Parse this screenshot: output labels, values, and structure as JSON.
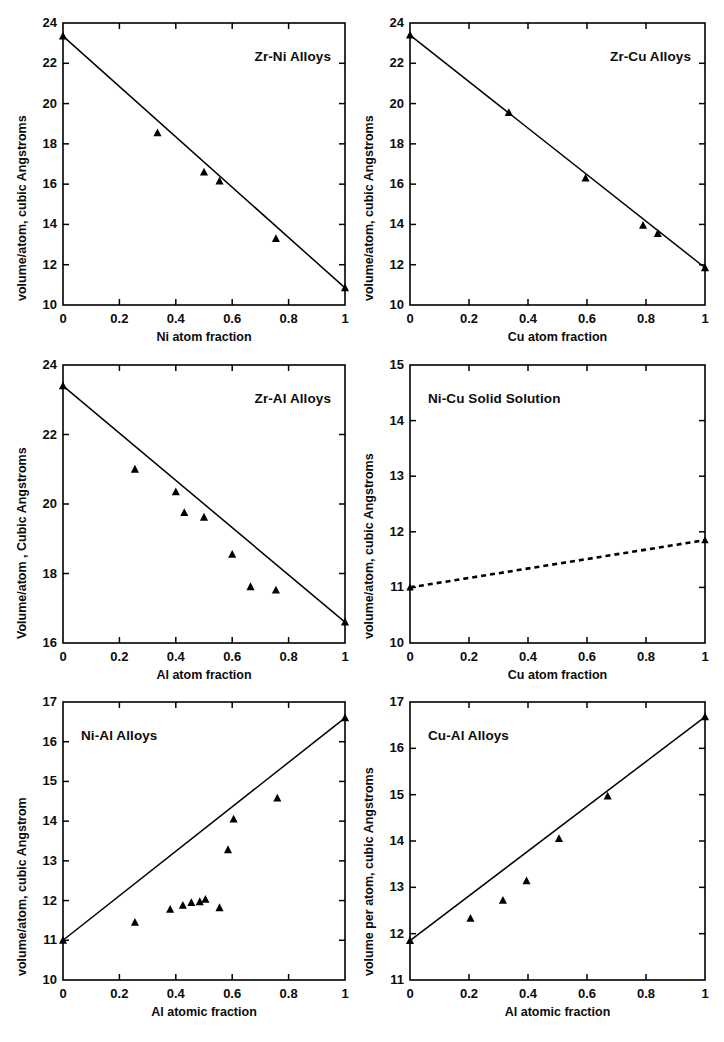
{
  "figure": {
    "panel_count": 6,
    "marker": "filled-triangle",
    "line_color": "#000000",
    "background": "#ffffff"
  },
  "chart_data": [
    {
      "id": "zr-ni",
      "type": "scatter",
      "title": "Zr-Ni Alloys",
      "title_pos": "top-right",
      "xlabel": "Ni atom fraction",
      "ylabel": "volume/atom, cubic Angstroms",
      "xlim": [
        0,
        1
      ],
      "ylim": [
        10,
        24
      ],
      "xticks": [
        0,
        0.2,
        0.4,
        0.6,
        0.8,
        1
      ],
      "xticklabels": [
        "0",
        "0.2",
        "0.4",
        "0.6",
        "0.8",
        "1"
      ],
      "yticks": [
        10,
        12,
        14,
        16,
        18,
        20,
        22,
        24
      ],
      "yticklabels": [
        "10",
        "12",
        "14",
        "16",
        "18",
        "20",
        "22",
        "24"
      ],
      "grid": false,
      "legend": "none",
      "points": [
        {
          "x": 0.0,
          "y": 23.35
        },
        {
          "x": 0.335,
          "y": 18.55
        },
        {
          "x": 0.5,
          "y": 16.6
        },
        {
          "x": 0.555,
          "y": 16.15
        },
        {
          "x": 0.755,
          "y": 13.3
        },
        {
          "x": 1.0,
          "y": 10.85
        }
      ],
      "fit_line": {
        "style": "solid",
        "x": [
          0,
          1
        ],
        "y": [
          23.35,
          10.85
        ]
      }
    },
    {
      "id": "zr-cu",
      "type": "scatter",
      "title": "Zr-Cu Alloys",
      "title_pos": "top-right",
      "xlabel": "Cu atom fraction",
      "ylabel": "volume/atom, cubic Angstroms",
      "xlim": [
        0,
        1
      ],
      "ylim": [
        10,
        24
      ],
      "xticks": [
        0,
        0.2,
        0.4,
        0.6,
        0.8,
        1
      ],
      "xticklabels": [
        "0",
        "0.2",
        "0.4",
        "0.6",
        "0.8",
        "1"
      ],
      "yticks": [
        10,
        12,
        14,
        16,
        18,
        20,
        22,
        24
      ],
      "yticklabels": [
        "10",
        "12",
        "14",
        "16",
        "18",
        "20",
        "22",
        "24"
      ],
      "grid": false,
      "legend": "none",
      "points": [
        {
          "x": 0.0,
          "y": 23.4
        },
        {
          "x": 0.335,
          "y": 19.55
        },
        {
          "x": 0.595,
          "y": 16.3
        },
        {
          "x": 0.79,
          "y": 13.95
        },
        {
          "x": 0.84,
          "y": 13.55
        },
        {
          "x": 1.0,
          "y": 11.85
        }
      ],
      "fit_line": {
        "style": "solid",
        "x": [
          0,
          1
        ],
        "y": [
          23.4,
          11.85
        ]
      }
    },
    {
      "id": "zr-al",
      "type": "scatter",
      "title": "Zr-Al Alloys",
      "title_pos": "top-right",
      "xlabel": "Al atom fraction",
      "ylabel": "Volume/atom , Cubic Angstroms",
      "xlim": [
        0,
        1
      ],
      "ylim": [
        16,
        24
      ],
      "xticks": [
        0,
        0.2,
        0.4,
        0.6,
        0.8,
        1
      ],
      "xticklabels": [
        "0",
        "0.2",
        "0.4",
        "0.6",
        "0.8",
        "1"
      ],
      "yticks": [
        16,
        18,
        20,
        22,
        24
      ],
      "yticklabels": [
        "16",
        "18",
        "20",
        "22",
        "24"
      ],
      "grid": false,
      "legend": "none",
      "points": [
        {
          "x": 0.0,
          "y": 23.4
        },
        {
          "x": 0.255,
          "y": 21.0
        },
        {
          "x": 0.4,
          "y": 20.35
        },
        {
          "x": 0.43,
          "y": 19.75
        },
        {
          "x": 0.5,
          "y": 19.62
        },
        {
          "x": 0.6,
          "y": 18.55
        },
        {
          "x": 0.665,
          "y": 17.62
        },
        {
          "x": 0.755,
          "y": 17.52
        },
        {
          "x": 1.0,
          "y": 16.6
        }
      ],
      "fit_line": {
        "style": "solid",
        "x": [
          0,
          1
        ],
        "y": [
          23.4,
          16.6
        ]
      }
    },
    {
      "id": "ni-cu",
      "type": "line",
      "title": "Ni-Cu Solid Solution",
      "title_pos": "top-left",
      "xlabel": "Cu atom fraction",
      "ylabel": "volume/atom, cubic Angstroms",
      "xlim": [
        0,
        1
      ],
      "ylim": [
        10,
        15
      ],
      "xticks": [
        0,
        0.2,
        0.4,
        0.6,
        0.8,
        1
      ],
      "xticklabels": [
        "0",
        "0.2",
        "0.4",
        "0.6",
        "0.8",
        "1"
      ],
      "yticks": [
        10,
        11,
        12,
        13,
        14,
        15
      ],
      "yticklabels": [
        "10",
        "11",
        "12",
        "13",
        "14",
        "15"
      ],
      "grid": false,
      "legend": "none",
      "points": [
        {
          "x": 0.0,
          "y": 11.0
        },
        {
          "x": 1.0,
          "y": 11.85
        }
      ],
      "fit_line": {
        "style": "dashed",
        "x": [
          0,
          1
        ],
        "y": [
          11.0,
          11.85
        ]
      }
    },
    {
      "id": "ni-al",
      "type": "scatter",
      "title": "Ni-Al Alloys",
      "title_pos": "top-left",
      "xlabel": "Al atomic fraction",
      "ylabel": "volume/atom, cubic Angstrom",
      "xlim": [
        0,
        1
      ],
      "ylim": [
        10,
        17
      ],
      "xticks": [
        0,
        0.2,
        0.4,
        0.6,
        0.8,
        1
      ],
      "xticklabels": [
        "0",
        "0.2",
        "0.4",
        "0.6",
        "0.8",
        "1"
      ],
      "yticks": [
        10,
        11,
        12,
        13,
        14,
        15,
        16,
        17
      ],
      "yticklabels": [
        "10",
        "11",
        "12",
        "13",
        "14",
        "15",
        "16",
        "17"
      ],
      "grid": false,
      "legend": "none",
      "points": [
        {
          "x": 0.0,
          "y": 11.0
        },
        {
          "x": 0.255,
          "y": 11.45
        },
        {
          "x": 0.38,
          "y": 11.78
        },
        {
          "x": 0.425,
          "y": 11.88
        },
        {
          "x": 0.455,
          "y": 11.95
        },
        {
          "x": 0.485,
          "y": 11.97
        },
        {
          "x": 0.505,
          "y": 12.03
        },
        {
          "x": 0.555,
          "y": 11.82
        },
        {
          "x": 0.585,
          "y": 13.28
        },
        {
          "x": 0.605,
          "y": 14.05
        },
        {
          "x": 0.76,
          "y": 14.58
        },
        {
          "x": 1.0,
          "y": 16.6
        }
      ],
      "fit_line": {
        "style": "solid",
        "x": [
          0,
          1
        ],
        "y": [
          11.0,
          16.6
        ]
      }
    },
    {
      "id": "cu-al",
      "type": "scatter",
      "title": "Cu-Al Alloys",
      "title_pos": "top-left",
      "xlabel": "Al atomic fraction",
      "ylabel": "volume per atom, cubic Angstroms",
      "xlim": [
        0,
        1
      ],
      "ylim": [
        11,
        17
      ],
      "xticks": [
        0,
        0.2,
        0.4,
        0.6,
        0.8,
        1
      ],
      "xticklabels": [
        "0",
        "0.2",
        "0.4",
        "0.6",
        "0.8",
        "1"
      ],
      "yticks": [
        11,
        12,
        13,
        14,
        15,
        16,
        17
      ],
      "yticklabels": [
        "11",
        "12",
        "13",
        "14",
        "15",
        "16",
        "17"
      ],
      "grid": false,
      "legend": "none",
      "points": [
        {
          "x": 0.0,
          "y": 11.85
        },
        {
          "x": 0.205,
          "y": 12.33
        },
        {
          "x": 0.315,
          "y": 12.72
        },
        {
          "x": 0.395,
          "y": 13.14
        },
        {
          "x": 0.505,
          "y": 14.05
        },
        {
          "x": 0.67,
          "y": 14.97
        },
        {
          "x": 1.0,
          "y": 16.68
        }
      ],
      "fit_line": {
        "style": "solid",
        "x": [
          0,
          1
        ],
        "y": [
          11.85,
          16.68
        ]
      }
    }
  ]
}
